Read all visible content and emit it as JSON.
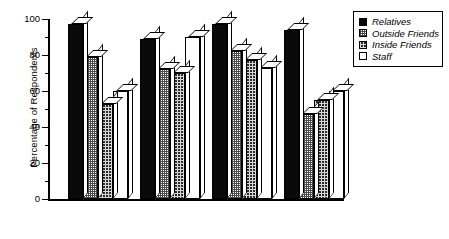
{
  "chart_data": {
    "type": "bar",
    "title": "",
    "xlabel": "",
    "ylabel": "Percentage of Respondents",
    "ylim": [
      0,
      100
    ],
    "ytick_labels": [
      "0",
      "20",
      "40",
      "60",
      "80",
      "100"
    ],
    "ytick_values": [
      0,
      20,
      40,
      60,
      80,
      100
    ],
    "minor_tick_values": [
      10,
      30,
      50,
      70,
      90
    ],
    "grid": false,
    "legend_position": "top-right",
    "categories": [
      "Residents",
      "Staff",
      "Aides",
      "Family"
    ],
    "series": [
      {
        "name": "Relatives",
        "swatch": "solid-black",
        "values": [
          97,
          89,
          97,
          94
        ]
      },
      {
        "name": "Outside Friends",
        "swatch": "light-checker",
        "values": [
          79,
          72,
          82,
          47
        ]
      },
      {
        "name": "Inside Friends",
        "swatch": "dark-checker",
        "values": [
          53,
          70,
          77,
          55
        ]
      },
      {
        "name": "Staff",
        "swatch": "white",
        "values": [
          60,
          90,
          73,
          60
        ]
      }
    ]
  },
  "legend": {
    "items": [
      {
        "label": "Relatives"
      },
      {
        "label": "Outside Friends"
      },
      {
        "label": "Inside Friends"
      },
      {
        "label": "Staff"
      }
    ]
  }
}
